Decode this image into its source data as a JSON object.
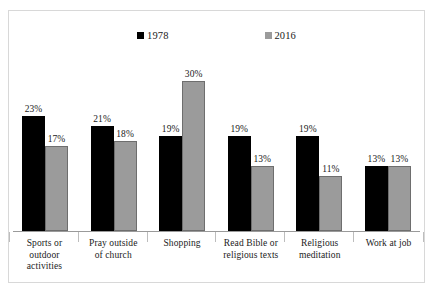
{
  "chart_data": {
    "type": "bar",
    "title": "",
    "xlabel": "",
    "ylabel": "",
    "ylim": [
      0,
      30
    ],
    "grid": false,
    "legend_position": "top",
    "categories": [
      "Sports or outdoor activities",
      "Pray outside of church",
      "Shopping",
      "Read Bible or religious texts",
      "Religious meditation",
      "Work at job"
    ],
    "category_lines": [
      [
        "Sports or",
        "outdoor",
        "activities"
      ],
      [
        "Pray outside",
        "of church"
      ],
      [
        "Shopping"
      ],
      [
        "Read Bible or",
        "religious texts"
      ],
      [
        "Religious",
        "meditation"
      ],
      [
        "Work at job"
      ]
    ],
    "series": [
      {
        "name": "1978",
        "color": "#000000",
        "values": [
          23,
          21,
          19,
          19,
          19,
          13
        ],
        "labels": [
          "23%",
          "21%",
          "19%",
          "19%",
          "19%",
          "13%"
        ]
      },
      {
        "name": "2016",
        "color": "#9b9b9b",
        "values": [
          17,
          18,
          30,
          13,
          11,
          13
        ],
        "labels": [
          "17%",
          "18%",
          "30%",
          "13%",
          "11%",
          "13%"
        ]
      }
    ]
  },
  "legend": {
    "entries": [
      {
        "label": "1978",
        "color": "#000000"
      },
      {
        "label": "2016",
        "color": "#9b9b9b"
      }
    ]
  }
}
